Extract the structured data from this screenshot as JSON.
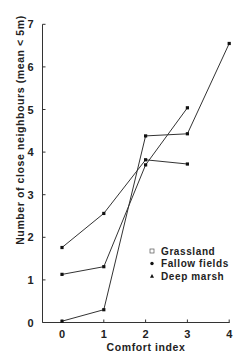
{
  "chart_data": {
    "type": "line",
    "title": "",
    "xlabel": "Comfort index",
    "ylabel": "Number of close neighbours (mean < 5m)",
    "xlim": [
      -0.45,
      4
    ],
    "ylim": [
      0,
      7
    ],
    "x_ticks": [
      0,
      1,
      2,
      3,
      4
    ],
    "y_ticks": [
      0,
      1,
      2,
      3,
      4,
      5,
      6,
      7
    ],
    "grid": false,
    "legend_position": "lower right (inside plot)",
    "series": [
      {
        "name": "Grassland",
        "marker": "open-square",
        "x": [
          0,
          1,
          2,
          3,
          4
        ],
        "values": [
          0.03,
          0.3,
          4.38,
          4.43,
          6.55
        ]
      },
      {
        "name": "Fallow fields",
        "marker": "filled-circle",
        "x": [
          0,
          1,
          2,
          3
        ],
        "values": [
          1.13,
          1.31,
          3.7,
          5.04
        ]
      },
      {
        "name": "Deep marsh",
        "marker": "filled-triangle",
        "x": [
          0,
          1,
          2,
          3
        ],
        "values": [
          1.76,
          2.56,
          3.82,
          3.72
        ]
      }
    ]
  },
  "legend": {
    "items": [
      {
        "label": "Grassland",
        "symbol": "□"
      },
      {
        "label": "Fallow fields",
        "symbol": "•"
      },
      {
        "label": "Deep marsh",
        "symbol": "▲"
      }
    ]
  }
}
